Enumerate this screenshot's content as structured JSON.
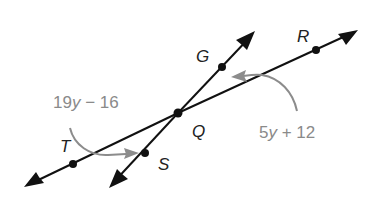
{
  "diagram": {
    "type": "geometry-intersecting-lines",
    "colors": {
      "line": "#111111",
      "angle_arrow": "#8c8c8c",
      "expression_text": "#8a8a8a",
      "point_label": "#222222"
    },
    "intersection": {
      "label": "Q",
      "x": 178,
      "y": 113
    },
    "lines": [
      {
        "name": "line-TR",
        "through": [
          "T",
          "Q",
          "R"
        ],
        "from": [
          24,
          187
        ],
        "to": [
          358,
          30
        ]
      },
      {
        "name": "line-SG",
        "through": [
          "S",
          "Q",
          "G"
        ],
        "from": [
          109,
          188
        ],
        "to": [
          255,
          31
        ]
      }
    ],
    "points": [
      {
        "label": "G",
        "x": 222,
        "y": 67,
        "label_x": 196,
        "label_y": 62
      },
      {
        "label": "R",
        "x": 316,
        "y": 50,
        "label_x": 297,
        "label_y": 42
      },
      {
        "label": "Q",
        "x": 178,
        "y": 113,
        "label_x": 192,
        "label_y": 137
      },
      {
        "label": "T",
        "x": 73,
        "y": 164,
        "label_x": 60,
        "label_y": 152
      },
      {
        "label": "S",
        "x": 145,
        "y": 153,
        "label_x": 158,
        "label_y": 170
      }
    ],
    "angles": [
      {
        "name": "angle-TQS",
        "expression": {
          "coef": "19",
          "var": "y",
          "rest": " − 16"
        },
        "label_x": 53,
        "label_y": 108
      },
      {
        "name": "angle-GQR",
        "expression": {
          "coef": "5",
          "var": "y",
          "rest": " + 12"
        },
        "label_x": 259,
        "label_y": 138
      }
    ]
  }
}
